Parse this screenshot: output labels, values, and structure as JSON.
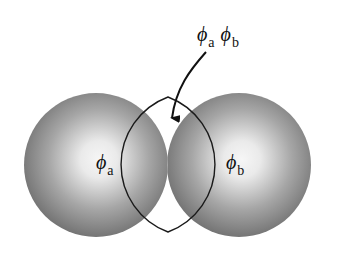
{
  "diagram": {
    "colors": {
      "background": "#ffffff",
      "sphere_center": "#f6f6f6",
      "sphere_edge": "#6b6b6b",
      "overlap_fill": "#a9a9a9",
      "outline": "#1a1a1a"
    },
    "spheres": [
      {
        "id": "a",
        "cx": 96,
        "cy": 165,
        "r": 72,
        "label_symbol": "ϕ",
        "label_subscript": "a"
      },
      {
        "id": "b",
        "cx": 239,
        "cy": 165,
        "r": 72,
        "label_symbol": "ϕ",
        "label_subscript": "b"
      }
    ],
    "overlap": {
      "label_terms": [
        {
          "symbol": "ϕ",
          "subscript": "a"
        },
        {
          "symbol": "ϕ",
          "subscript": "b"
        }
      ],
      "top": [
        168,
        97
      ],
      "bottom": [
        168,
        232
      ]
    },
    "arrow": {
      "from": [
        206,
        52
      ],
      "to": [
        172,
        126
      ]
    }
  }
}
